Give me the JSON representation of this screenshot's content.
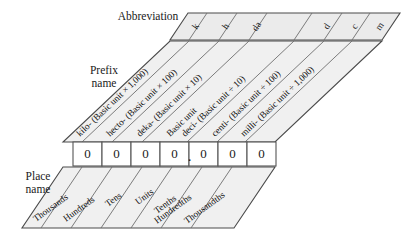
{
  "figure": {
    "labels": {
      "abbreviation": "Abbreviation",
      "prefix_name_line1": "Prefix",
      "prefix_name_line2": "name",
      "place_name_line1": "Place",
      "place_name_line2": "name"
    },
    "colors": {
      "band_fill": "#ebebeb",
      "band_stroke": "#4a4a4a",
      "divider": "#6e6e6e",
      "digit_box_fill": "#ffffff",
      "digit_box_stroke": "#555555",
      "text": "#1a1a1a"
    },
    "columns": [
      {
        "abbreviation": "k",
        "prefix": "kilo- (Basic unit × 1,000)",
        "place": "Thousands",
        "digit": "0"
      },
      {
        "abbreviation": "h",
        "prefix": "hecto- (Basic unit × 100)",
        "place": "Hundreds",
        "digit": "0"
      },
      {
        "abbreviation": "da",
        "prefix": "deka- (Basic unit × 10)",
        "place": "Tens",
        "digit": "0"
      },
      {
        "abbreviation": "",
        "prefix": "Basic unit",
        "place": "Units",
        "digit": "0"
      },
      {
        "abbreviation": "d",
        "prefix": "deci- (Basic unit ÷ 10)",
        "place": "Tenths",
        "digit": "0"
      },
      {
        "abbreviation": "c",
        "prefix": "centi- (Basic unit ÷ 100)",
        "place": "Hundredths",
        "digit": "0"
      },
      {
        "abbreviation": "m",
        "prefix": "milli- (Basic unit ÷ 1,000)",
        "place": "Thousandths",
        "digit": "0"
      }
    ],
    "decimal_point": "."
  }
}
